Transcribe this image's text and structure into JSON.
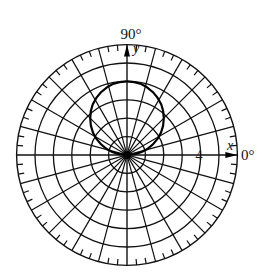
{
  "diagram": {
    "type": "polar-coordinate-grid",
    "center": {
      "x": 127,
      "y": 155
    },
    "unit_px": 18.4,
    "outer_radius_units": 6,
    "rings": [
      1,
      2,
      3,
      4,
      5
    ],
    "spoke_step_deg": 15,
    "tick_step_deg": 5,
    "tick_length_px": 6,
    "curve": {
      "label": "r = 4 sin θ",
      "shape": "circle",
      "diameter_units": 4,
      "center_units": {
        "x": 0,
        "y": 2
      }
    },
    "labels": {
      "angle_90": "90°",
      "angle_0": "0°",
      "axis_y": "y",
      "axis_x": "x",
      "ring_value": "4"
    },
    "colors": {
      "line": "#111111",
      "curve": "#000000",
      "background": "#ffffff"
    }
  }
}
